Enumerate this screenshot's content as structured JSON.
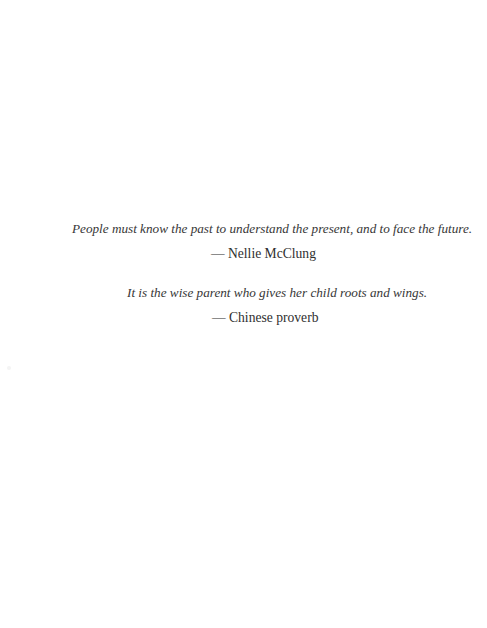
{
  "page": {
    "background_color": "#ffffff",
    "text_color": "#373737",
    "attribution_color": "#2f2f2f"
  },
  "epigraphs": [
    {
      "quote": "People must know the past to understand the present, and to face the future.",
      "attribution": "— Nellie McClung"
    },
    {
      "quote": "It is the wise parent who gives her child roots and wings.",
      "attribution": "— Chinese proverb"
    }
  ]
}
